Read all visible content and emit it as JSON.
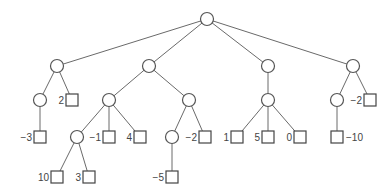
{
  "diagram": {
    "type": "game-tree",
    "nodes": [
      {
        "id": "n0",
        "shape": "circle",
        "x": 207,
        "y": 19
      },
      {
        "id": "n1",
        "shape": "circle",
        "x": 57,
        "y": 66,
        "parent": "n0"
      },
      {
        "id": "n2",
        "shape": "circle",
        "x": 149,
        "y": 66,
        "parent": "n0"
      },
      {
        "id": "n3",
        "shape": "circle",
        "x": 268,
        "y": 66,
        "parent": "n0"
      },
      {
        "id": "n4",
        "shape": "circle",
        "x": 353,
        "y": 66,
        "parent": "n0"
      },
      {
        "id": "n5",
        "shape": "circle",
        "x": 40,
        "y": 100,
        "parent": "n1"
      },
      {
        "id": "n6",
        "shape": "square",
        "x": 72,
        "y": 100,
        "parent": "n1",
        "value": "2",
        "label_side": "left"
      },
      {
        "id": "n7",
        "shape": "circle",
        "x": 109,
        "y": 100,
        "parent": "n2"
      },
      {
        "id": "n8",
        "shape": "circle",
        "x": 189,
        "y": 100,
        "parent": "n2"
      },
      {
        "id": "n9",
        "shape": "circle",
        "x": 268,
        "y": 100,
        "parent": "n3"
      },
      {
        "id": "n10",
        "shape": "circle",
        "x": 337,
        "y": 100,
        "parent": "n4"
      },
      {
        "id": "n11",
        "shape": "square",
        "x": 370,
        "y": 100,
        "parent": "n4",
        "value": "−2",
        "label_side": "left"
      },
      {
        "id": "n12",
        "shape": "square",
        "x": 40,
        "y": 137,
        "parent": "n5",
        "value": "−3",
        "label_side": "left"
      },
      {
        "id": "n13",
        "shape": "circle",
        "x": 77,
        "y": 137,
        "parent": "n7"
      },
      {
        "id": "n14",
        "shape": "square",
        "x": 109,
        "y": 137,
        "parent": "n7",
        "value": "−1",
        "label_side": "left"
      },
      {
        "id": "n15",
        "shape": "square",
        "x": 140,
        "y": 137,
        "parent": "n7",
        "value": "4",
        "label_side": "left"
      },
      {
        "id": "n16",
        "shape": "circle",
        "x": 172,
        "y": 137,
        "parent": "n8"
      },
      {
        "id": "n17",
        "shape": "square",
        "x": 205,
        "y": 137,
        "parent": "n8",
        "value": "−2",
        "label_side": "left"
      },
      {
        "id": "n18",
        "shape": "square",
        "x": 237,
        "y": 137,
        "parent": "n9",
        "value": "1",
        "label_side": "left"
      },
      {
        "id": "n19",
        "shape": "square",
        "x": 268,
        "y": 137,
        "parent": "n9",
        "value": "5",
        "label_side": "left"
      },
      {
        "id": "n20",
        "shape": "square",
        "x": 300,
        "y": 137,
        "parent": "n9",
        "value": "0",
        "label_side": "left"
      },
      {
        "id": "n21",
        "shape": "square",
        "x": 337,
        "y": 137,
        "parent": "n10",
        "value": "−10",
        "label_side": "right"
      },
      {
        "id": "n22",
        "shape": "square",
        "x": 57,
        "y": 177,
        "parent": "n13",
        "value": "10",
        "label_side": "left"
      },
      {
        "id": "n23",
        "shape": "square",
        "x": 89,
        "y": 177,
        "parent": "n13",
        "value": "3",
        "label_side": "left"
      },
      {
        "id": "n24",
        "shape": "square",
        "x": 172,
        "y": 177,
        "parent": "n16",
        "value": "−5",
        "label_side": "left"
      }
    ],
    "style": {
      "circle_radius": 6.5,
      "square_size": 12,
      "edge_color": "#6a6a6a",
      "node_stroke": "#555555",
      "label_color": "#444444"
    }
  }
}
